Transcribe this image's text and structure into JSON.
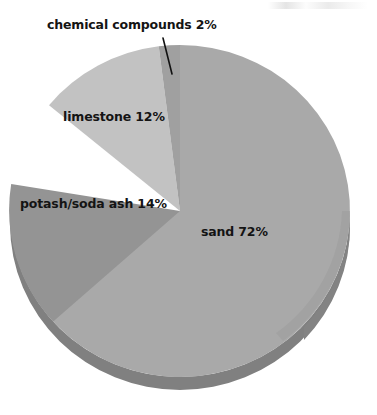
{
  "figure": {
    "background_color": "#ffffff",
    "geometry": {
      "center_x": 180,
      "center_y": 211,
      "radius_x": 170,
      "radius_y": 166,
      "depth": 13
    },
    "leader_line": {
      "name": "chemical-compounds-leader-line",
      "color": "#111111",
      "x1": 163,
      "y1": 38,
      "x2": 172,
      "y2": 74
    }
  },
  "chart_data": {
    "type": "pie",
    "title": "",
    "subtitle": "",
    "xlabel": "",
    "ylabel": "",
    "legend_position": "none",
    "grid": false,
    "style": "3d-pie",
    "units": "percent",
    "total": 100,
    "categories": [
      "sand",
      "potash/soda ash",
      "limestone",
      "chemical compounds"
    ],
    "values": [
      72,
      14,
      12,
      2
    ],
    "slices": [
      {
        "name": "sand",
        "label": "sand 72%",
        "value": 72,
        "percent": "72%",
        "color": "#a9a9a9",
        "side_color": "#808080",
        "start_angle": 0,
        "end_angle": 259.2
      },
      {
        "name": "potash/soda ash",
        "label": "potash/soda ash 14%",
        "value": 14,
        "percent": "14%",
        "color": "#949494",
        "side_color": "#747474",
        "start_angle": 259.2,
        "end_angle": 309.6
      },
      {
        "name": "limestone",
        "label": "limestone 12%",
        "value": 12,
        "percent": "12%",
        "color": "#c2c2c2",
        "side_color": "#9a9a9a",
        "start_angle": 309.6,
        "end_angle": 352.8
      },
      {
        "name": "chemical compounds",
        "label": "chemical compounds 2%",
        "value": 2,
        "percent": "2%",
        "color": "#a0a0a0",
        "side_color": "#7d7d7d",
        "start_angle": 352.8,
        "end_angle": 360
      }
    ],
    "annotations": [
      {
        "name": "chemical-compounds-callout",
        "text": "chemical compounds 2%",
        "has_leader_line": true
      }
    ]
  },
  "labels": {
    "sand": "sand 72%",
    "potash": "potash/soda ash 14%",
    "limestone": "limestone 12%",
    "chemical": "chemical compounds 2%"
  }
}
